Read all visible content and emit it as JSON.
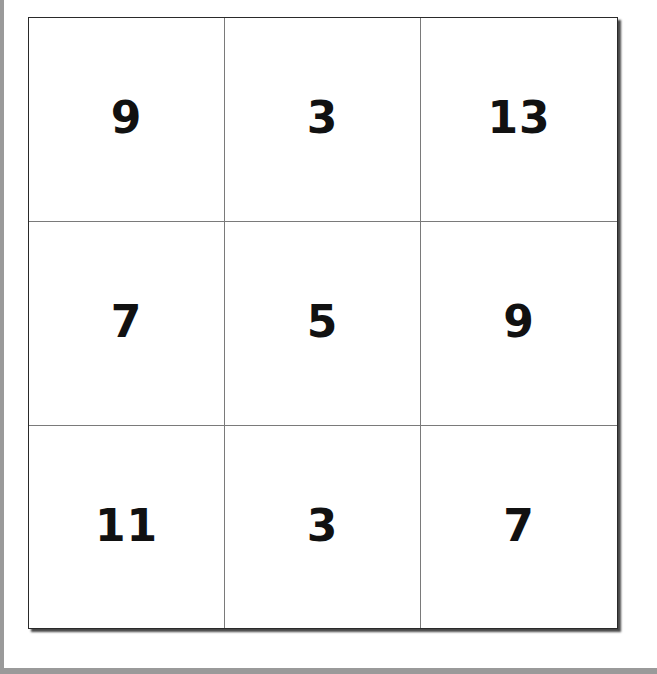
{
  "puzzle": {
    "type": "3x3 number grid",
    "rows": [
      [
        "9",
        "3",
        "13"
      ],
      [
        "7",
        "5",
        "9"
      ],
      [
        "11",
        "3",
        "7"
      ]
    ]
  },
  "colors": {
    "grid_border": "#2a2a2a",
    "grid_lines": "#7a7a7a",
    "digits": "#111111",
    "frame": "#9a9a9a",
    "background": "#ffffff"
  }
}
